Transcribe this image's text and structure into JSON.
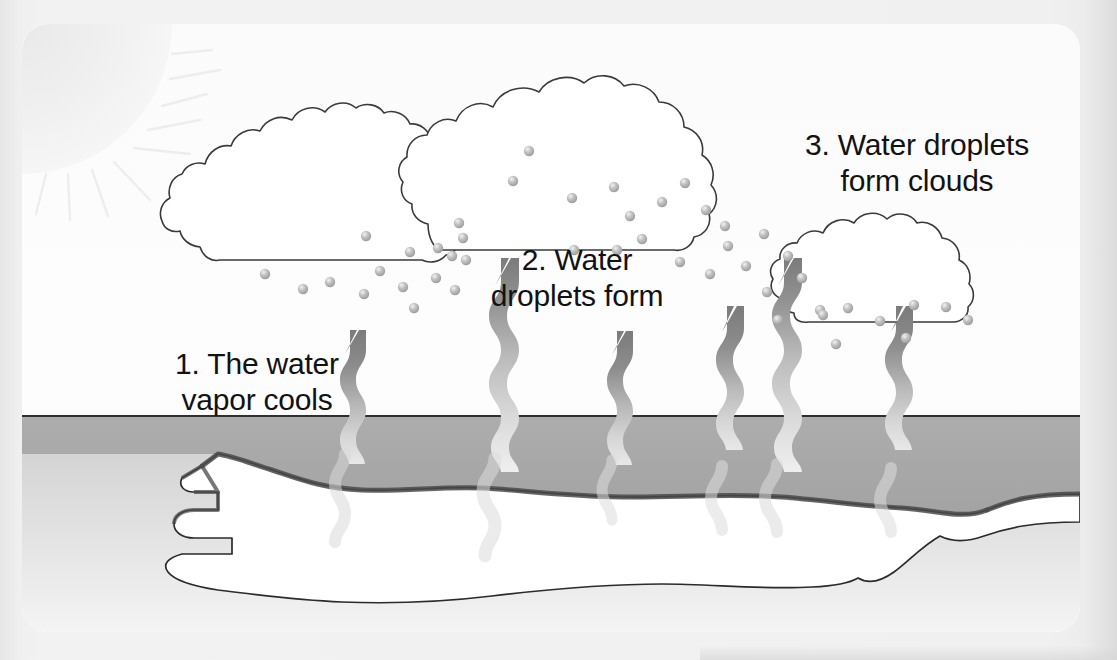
{
  "diagram": {
    "type": "scientific-illustration",
    "style": "black-and-white line art with gray shading",
    "labels": [
      {
        "id": "step-1",
        "line1": "1. The water",
        "line2": "vapor cools",
        "text": "1. The water\nvapor cools"
      },
      {
        "id": "step-2",
        "line1": "2. Water",
        "line2": "droplets form",
        "text": "2. Water\ndroplets form"
      },
      {
        "id": "step-3",
        "line1": "3. Water droplets",
        "line2": "form clouds",
        "text": "3. Water droplets\nform clouds"
      }
    ],
    "elements": {
      "sun": {
        "name": "sun",
        "position": "top-left-corner",
        "rays": 9,
        "shade": "#f2f2f2"
      },
      "clouds": [
        {
          "name": "left-cloud",
          "x": 200,
          "y": 100,
          "width": 300,
          "height": 170
        },
        {
          "name": "center-cloud",
          "x": 430,
          "y": 40,
          "width": 300,
          "height": 190
        },
        {
          "name": "right-cloud",
          "x": 810,
          "y": 200,
          "width": 250,
          "height": 110
        }
      ],
      "vapor_arrows": {
        "count": 6,
        "description": "wavy vapor arrows rising from water"
      },
      "droplets": {
        "count": 40,
        "description": "small gray water droplet spheres"
      },
      "ground": {
        "name": "ground",
        "top_y": 415,
        "fill": "#a9a9a9"
      },
      "lake": {
        "name": "lake",
        "fill": "#ffffff",
        "description": "white puddle / lake seen in perspective"
      }
    },
    "colors": {
      "outline": "#2b2b2b",
      "ground": "#a9a9a9",
      "arrow_dark": "#7d7d7d",
      "arrow_light": "#dcdcdc",
      "droplet": "#b4b4b4",
      "panel": "#fcfcfc",
      "page": "#ededed",
      "text": "#121212"
    }
  }
}
